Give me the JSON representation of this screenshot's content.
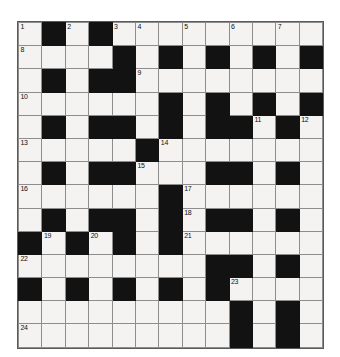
{
  "puzzle": {
    "type": "crossword-grid",
    "columns": 13,
    "rows": 14,
    "colors": {
      "block": "#121212",
      "cell": "#f4f3f1",
      "grid_line": "#8d8d8d",
      "number_text": "#111111",
      "page_background": "#ffffff"
    },
    "clue_numbers_present": [
      "1",
      "2",
      "3",
      "4",
      "5",
      "6",
      "7",
      "8",
      "9",
      "10",
      "11",
      "12",
      "13",
      "14",
      "15",
      "16",
      "17",
      "18",
      "19",
      "20",
      "21",
      "22",
      "23",
      "24"
    ],
    "legend": {
      "0": "white (fillable) cell",
      "1": "black (blocked) cell"
    },
    "cells": [
      [
        0,
        1,
        0,
        1,
        0,
        0,
        0,
        0,
        0,
        0,
        0,
        0,
        0
      ],
      [
        0,
        0,
        0,
        0,
        1,
        0,
        1,
        0,
        1,
        0,
        1,
        0,
        1
      ],
      [
        0,
        1,
        0,
        1,
        1,
        0,
        0,
        0,
        0,
        0,
        0,
        0,
        0
      ],
      [
        0,
        0,
        0,
        0,
        0,
        0,
        1,
        0,
        1,
        0,
        1,
        0,
        1
      ],
      [
        0,
        1,
        0,
        1,
        1,
        0,
        1,
        0,
        1,
        1,
        0,
        1,
        0
      ],
      [
        0,
        0,
        0,
        0,
        0,
        1,
        0,
        0,
        0,
        0,
        0,
        0,
        0
      ],
      [
        0,
        1,
        0,
        1,
        1,
        0,
        0,
        0,
        1,
        1,
        0,
        1,
        0
      ],
      [
        0,
        0,
        0,
        0,
        0,
        0,
        1,
        0,
        0,
        0,
        0,
        0,
        0
      ],
      [
        0,
        1,
        0,
        1,
        1,
        0,
        1,
        0,
        1,
        1,
        0,
        1,
        0
      ],
      [
        1,
        0,
        1,
        0,
        1,
        0,
        1,
        0,
        0,
        0,
        0,
        0,
        0
      ],
      [
        0,
        0,
        0,
        0,
        0,
        0,
        0,
        0,
        1,
        1,
        0,
        1,
        0
      ],
      [
        1,
        0,
        1,
        0,
        1,
        0,
        1,
        0,
        1,
        0,
        0,
        0,
        0
      ],
      [
        0,
        0,
        0,
        0,
        0,
        0,
        0,
        0,
        0,
        1,
        0,
        1,
        0
      ],
      [
        0,
        0,
        0,
        0,
        0,
        0,
        0,
        0,
        0,
        1,
        0,
        1,
        0
      ]
    ],
    "numbers": [
      {
        "row": 0,
        "col": 0,
        "label": "1"
      },
      {
        "row": 0,
        "col": 2,
        "label": "2"
      },
      {
        "row": 0,
        "col": 4,
        "label": "3"
      },
      {
        "row": 0,
        "col": 5,
        "label": "4"
      },
      {
        "row": 0,
        "col": 7,
        "label": "5"
      },
      {
        "row": 0,
        "col": 9,
        "label": "6"
      },
      {
        "row": 0,
        "col": 11,
        "label": "7"
      },
      {
        "row": 1,
        "col": 0,
        "label": "8"
      },
      {
        "row": 2,
        "col": 5,
        "label": "9"
      },
      {
        "row": 3,
        "col": 0,
        "label": "10"
      },
      {
        "row": 4,
        "col": 10,
        "label": "11"
      },
      {
        "row": 4,
        "col": 12,
        "label": "12"
      },
      {
        "row": 5,
        "col": 0,
        "label": "13"
      },
      {
        "row": 5,
        "col": 6,
        "label": "14"
      },
      {
        "row": 6,
        "col": 5,
        "label": "15"
      },
      {
        "row": 7,
        "col": 0,
        "label": "16"
      },
      {
        "row": 7,
        "col": 7,
        "label": "17"
      },
      {
        "row": 8,
        "col": 7,
        "label": "18"
      },
      {
        "row": 9,
        "col": 1,
        "label": "19"
      },
      {
        "row": 9,
        "col": 3,
        "label": "20"
      },
      {
        "row": 9,
        "col": 7,
        "label": "21"
      },
      {
        "row": 10,
        "col": 0,
        "label": "22"
      },
      {
        "row": 11,
        "col": 9,
        "label": "23"
      },
      {
        "row": 13,
        "col": 0,
        "label": "24"
      }
    ],
    "entries": []
  }
}
